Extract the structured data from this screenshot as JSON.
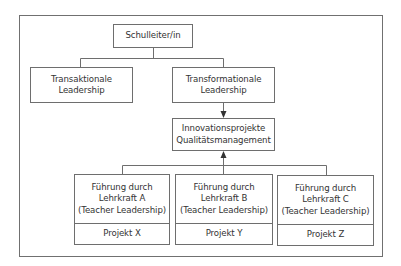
{
  "diagram": {
    "root": {
      "label": "Schulleiter/in"
    },
    "leadership_types": [
      {
        "line1": "Transaktionale",
        "line2": "Leadership"
      },
      {
        "line1": "Transformationale",
        "line2": "Leadership"
      }
    ],
    "innovation": {
      "line1": "Innovationsprojekte",
      "line2": "Qualitätsmanagement"
    },
    "teachers": [
      {
        "line1": "Führung durch",
        "line2": "Lehrkraft A",
        "line3": "(Teacher Leadership)",
        "project": "Projekt X"
      },
      {
        "line1": "Führung durch",
        "line2": "Lehrkraft B",
        "line3": "(Teacher Leadership)",
        "project": "Projekt Y"
      },
      {
        "line1": "Führung durch",
        "line2": "Lehrkraft C",
        "line3": "(Teacher Leadership)",
        "project": "Projekt Z"
      }
    ],
    "colors": {
      "line": "#6e6e6e",
      "text": "#333333",
      "background": "#ffffff"
    }
  }
}
